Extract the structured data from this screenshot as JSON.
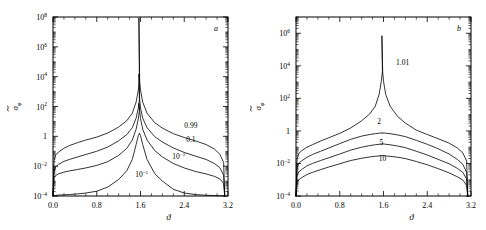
{
  "figure": {
    "panels": [
      {
        "letter": "a",
        "xlabel": "ϑ",
        "ylabel_base": "σ",
        "ylabel_sub": "φ",
        "xticks": [
          "0.0",
          "0.8",
          "1.6",
          "2.4",
          "3.2"
        ],
        "xtick_values": [
          0.0,
          0.8,
          1.6,
          2.4,
          3.2
        ],
        "yticks": [
          {
            "mantissa": "10",
            "exp": "8"
          },
          {
            "mantissa": "10",
            "exp": "6"
          },
          {
            "mantissa": "10",
            "exp": "4"
          },
          {
            "mantissa": "10",
            "exp": "2"
          },
          {
            "mantissa": "1",
            "exp": ""
          },
          {
            "mantissa": "10",
            "exp": "−2"
          },
          {
            "mantissa": "10",
            "exp": "−4"
          }
        ],
        "ytick_values": [
          8,
          6,
          4,
          2,
          0,
          -2,
          -4
        ],
        "curve_labels": [
          {
            "text": "0.99",
            "exp": "",
            "x": 2.52,
            "y_log": 0.55
          },
          {
            "text": "0.1",
            "exp": "",
            "x": 2.52,
            "y_log": -0.35
          },
          {
            "text": "10",
            "exp": "−2",
            "x": 2.3,
            "y_log": -1.55
          },
          {
            "text": "10",
            "exp": "−5",
            "x": 1.62,
            "y_log": -2.7
          }
        ]
      },
      {
        "letter": "b",
        "xlabel": "ϑ",
        "ylabel_base": "σ",
        "ylabel_sub": "φ",
        "xticks": [
          "0.0",
          "0.8",
          "1.6",
          "2.4",
          "3.2"
        ],
        "xtick_values": [
          0.0,
          0.8,
          1.6,
          2.4,
          3.2
        ],
        "yticks": [
          {
            "mantissa": "10",
            "exp": "6"
          },
          {
            "mantissa": "10",
            "exp": "4"
          },
          {
            "mantissa": "10",
            "exp": "2"
          },
          {
            "mantissa": "1",
            "exp": ""
          },
          {
            "mantissa": "10",
            "exp": "−2"
          },
          {
            "mantissa": "10",
            "exp": "−4"
          }
        ],
        "ytick_values": [
          6,
          4,
          2,
          0,
          -2,
          -4
        ],
        "curve_labels": [
          {
            "text": "1.01",
            "exp": "",
            "x": 1.95,
            "y_log": 4.05
          },
          {
            "text": "2",
            "exp": "",
            "x": 1.52,
            "y_log": 0.42
          },
          {
            "text": "5",
            "exp": "",
            "x": 1.56,
            "y_log": -0.85
          },
          {
            "text": "10",
            "exp": "",
            "x": 1.58,
            "y_log": -1.85
          }
        ]
      }
    ]
  },
  "chart_data": [
    {
      "type": "line",
      "title": "",
      "panel": "a",
      "xlabel": "ϑ",
      "ylabel": "σ̃_φ",
      "xlim": [
        0.0,
        3.2
      ],
      "ylim_log10": [
        -4,
        8
      ],
      "yscale": "log",
      "grid": false,
      "legend": "inline-curve-labels",
      "x": [
        0.0,
        0.02,
        0.05,
        0.1,
        0.2,
        0.3,
        0.45,
        0.6,
        0.8,
        1.0,
        1.2,
        1.35,
        1.45,
        1.52,
        1.56,
        1.58,
        1.5708,
        1.585,
        1.6,
        1.64,
        1.72,
        1.86,
        2.0,
        2.2,
        2.4,
        2.6,
        2.8,
        2.95,
        3.05,
        3.12,
        3.14
      ],
      "series": [
        {
          "name": "0.99",
          "values_log10": [
            -4.0,
            -1.6,
            -1.25,
            -1.05,
            -0.8,
            -0.62,
            -0.42,
            -0.25,
            -0.05,
            0.22,
            0.62,
            1.05,
            1.55,
            2.3,
            3.1,
            3.7,
            7.95,
            3.7,
            3.1,
            2.3,
            1.55,
            0.92,
            0.55,
            0.18,
            -0.08,
            -0.3,
            -0.55,
            -0.85,
            -1.2,
            -1.75,
            -4.0
          ]
        },
        {
          "name": "0.1",
          "values_log10": [
            -4.0,
            -2.35,
            -2.05,
            -1.88,
            -1.68,
            -1.55,
            -1.38,
            -1.22,
            -1.0,
            -0.72,
            -0.3,
            0.12,
            0.58,
            1.22,
            1.9,
            2.45,
            4.18,
            2.45,
            1.9,
            1.22,
            0.58,
            -0.02,
            -0.38,
            -0.78,
            -1.08,
            -1.32,
            -1.55,
            -1.82,
            -2.1,
            -2.6,
            -4.0
          ]
        },
        {
          "name": "10⁻²",
          "values_log10": [
            -4.0,
            -2.78,
            -2.62,
            -2.52,
            -2.4,
            -2.32,
            -2.22,
            -2.12,
            -1.95,
            -1.7,
            -1.28,
            -0.8,
            -0.25,
            0.48,
            1.18,
            1.72,
            2.22,
            1.72,
            1.18,
            0.48,
            -0.25,
            -0.95,
            -1.38,
            -1.82,
            -2.12,
            -2.35,
            -2.52,
            -2.68,
            -2.85,
            -3.15,
            -4.0
          ]
        },
        {
          "name": "10⁻⁵",
          "values_log10": [
            -4.0,
            -3.98,
            -3.96,
            -3.94,
            -3.92,
            -3.9,
            -3.86,
            -3.8,
            -3.68,
            -3.4,
            -2.9,
            -2.3,
            -1.55,
            -0.55,
            0.05,
            0.18,
            0.22,
            0.18,
            0.05,
            -0.55,
            -1.55,
            -2.5,
            -3.0,
            -3.55,
            -3.8,
            -3.9,
            -3.95,
            -3.97,
            -3.98,
            -3.99,
            -4.0
          ]
        }
      ]
    },
    {
      "type": "line",
      "title": "",
      "panel": "b",
      "xlabel": "ϑ",
      "ylabel": "σ̃_φ",
      "xlim": [
        0.0,
        3.2
      ],
      "ylim_log10": [
        -4,
        7
      ],
      "yscale": "log",
      "grid": false,
      "legend": "inline-curve-labels",
      "x": [
        0.0,
        0.02,
        0.05,
        0.1,
        0.2,
        0.3,
        0.45,
        0.6,
        0.8,
        1.0,
        1.2,
        1.35,
        1.45,
        1.52,
        1.56,
        1.58,
        1.5708,
        1.585,
        1.6,
        1.64,
        1.72,
        1.86,
        2.0,
        2.2,
        2.4,
        2.6,
        2.8,
        2.95,
        3.05,
        3.12,
        3.14
      ],
      "series": [
        {
          "name": "1.01",
          "values_log10": [
            -4.0,
            -1.7,
            -1.4,
            -1.22,
            -1.0,
            -0.85,
            -0.62,
            -0.42,
            -0.15,
            0.18,
            0.62,
            1.05,
            1.52,
            2.25,
            3.05,
            3.65,
            5.85,
            3.65,
            3.05,
            2.25,
            1.52,
            0.88,
            0.48,
            0.05,
            -0.22,
            -0.48,
            -0.75,
            -1.05,
            -1.35,
            -1.85,
            -4.0
          ]
        },
        {
          "name": "2",
          "values_log10": [
            -4.0,
            -2.25,
            -2.0,
            -1.85,
            -1.62,
            -1.45,
            -1.25,
            -1.05,
            -0.78,
            -0.52,
            -0.32,
            -0.22,
            -0.17,
            -0.14,
            -0.13,
            -0.13,
            -0.13,
            -0.13,
            -0.13,
            -0.14,
            -0.17,
            -0.25,
            -0.35,
            -0.58,
            -0.82,
            -1.1,
            -1.42,
            -1.75,
            -2.05,
            -2.55,
            -4.0
          ]
        },
        {
          "name": "5",
          "values_log10": [
            -4.0,
            -2.75,
            -2.52,
            -2.38,
            -2.15,
            -2.0,
            -1.82,
            -1.65,
            -1.42,
            -1.18,
            -1.0,
            -0.9,
            -0.85,
            -0.82,
            -0.8,
            -0.8,
            -0.8,
            -0.8,
            -0.8,
            -0.82,
            -0.85,
            -0.93,
            -1.03,
            -1.25,
            -1.48,
            -1.75,
            -2.02,
            -2.3,
            -2.55,
            -2.95,
            -4.0
          ]
        },
        {
          "name": "10",
          "values_log10": [
            -4.0,
            -3.2,
            -3.0,
            -2.88,
            -2.68,
            -2.55,
            -2.38,
            -2.22,
            -2.02,
            -1.82,
            -1.68,
            -1.6,
            -1.56,
            -1.54,
            -1.52,
            -1.52,
            -1.52,
            -1.52,
            -1.52,
            -1.54,
            -1.56,
            -1.62,
            -1.7,
            -1.88,
            -2.08,
            -2.32,
            -2.58,
            -2.82,
            -3.02,
            -3.35,
            -4.0
          ]
        }
      ]
    }
  ]
}
